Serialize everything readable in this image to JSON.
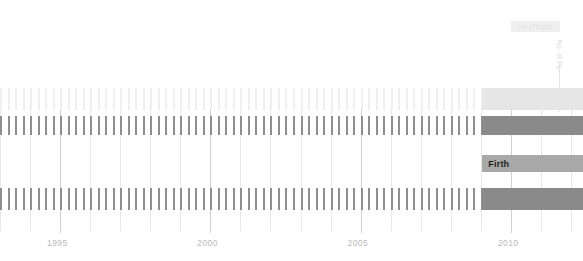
{
  "chart_data": {
    "type": "bar",
    "title": "",
    "subtitle": "",
    "xlabel": "",
    "ylabel": "",
    "xlim": [
      1993.0,
      2012.4
    ],
    "grid": true,
    "legend_position": "none",
    "orientation": "horizontal-timeline",
    "x_tick_labels": [
      "1995",
      "2000",
      "2005",
      "2010"
    ],
    "x_tick_values": [
      1995,
      2000,
      2005,
      2010
    ],
    "x_minor_interval": 1,
    "tick_interval_years": 0.25,
    "tick_series_start": 1993.0,
    "tick_series_end": 2009.05,
    "solid_start": 2009.05,
    "solid_end": 2012.4,
    "series": [
      {
        "name": "row-1-light",
        "row_index": 0,
        "y_top_px": 88,
        "height_px": 22,
        "tick_color": "#efefef",
        "solid_color": "#e6e6e6",
        "tick_width_px": 2,
        "has_ticks": true,
        "has_solid": true,
        "label": ""
      },
      {
        "name": "row-2-dark",
        "row_index": 1,
        "y_top_px": 116,
        "height_px": 19,
        "tick_color": "#8e8e8e",
        "solid_color": "#8a8a8a",
        "tick_width_px": 2,
        "has_ticks": true,
        "has_solid": true,
        "label": ""
      },
      {
        "name": "row-3-medium",
        "row_index": 2,
        "y_top_px": 155,
        "height_px": 17,
        "tick_color": "#bdbdbd",
        "solid_color": "#a8a8a8",
        "tick_width_px": 2,
        "has_ticks": false,
        "has_solid": true,
        "label": "Firth"
      },
      {
        "name": "row-4-dark",
        "row_index": 3,
        "y_top_px": 188,
        "height_px": 22,
        "tick_color": "#8e8e8e",
        "solid_color": "#8a8a8a",
        "tick_width_px": 2,
        "has_ticks": true,
        "has_solid": true,
        "label": ""
      }
    ],
    "annotations": [
      {
        "name": "badge",
        "text": "pll official",
        "x_px": 511,
        "y_px": 21
      },
      {
        "name": "vertical-label",
        "text": "No. of PL",
        "x_px": 563,
        "y_px": 40
      },
      {
        "name": "firth-label",
        "text": "Firth",
        "x_px": 474,
        "y_px": 157
      }
    ],
    "colors": {
      "background": "#ffffff",
      "grid_minor": "#e8e8e8",
      "grid_major": "#cfcfcf",
      "axis_text": "#b9b9b9",
      "band_light": "#e6e6e6",
      "band_medium": "#a8a8a8",
      "band_dark": "#8a8a8a",
      "label_text": "#1d1d1d",
      "badge_bg": "#efefef",
      "badge_text": "#e2e2e2"
    }
  },
  "axis": {
    "labels": [
      {
        "text": "1995",
        "value": 1995
      },
      {
        "text": "2000",
        "value": 2000
      },
      {
        "text": "2005",
        "value": 2005
      },
      {
        "text": "2010",
        "value": 2010
      }
    ]
  },
  "annotations": {
    "badge_text": "pll official",
    "vertical_label": "No. of PL",
    "firth_label": "Firth"
  }
}
